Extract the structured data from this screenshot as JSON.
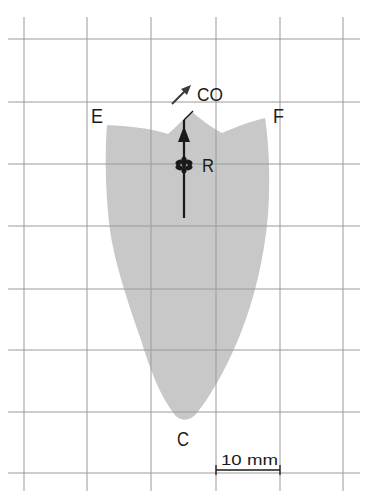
{
  "diagram": {
    "type": "field-map-on-grid",
    "grid": {
      "color": "#9a9a9a",
      "vertical_x": [
        24,
        87,
        151,
        216,
        280,
        343
      ],
      "horizontal_y": [
        39,
        102,
        164,
        226,
        289,
        350,
        412,
        473
      ],
      "x_extent": [
        8,
        360
      ],
      "y_extent": [
        17,
        491
      ]
    },
    "region": {
      "fill": "#c8c8c8",
      "description": "shield-shaped gray region tapering to point C"
    },
    "labels": {
      "E": "E",
      "F": "F",
      "C": "C",
      "R": "R",
      "CO": "CO"
    },
    "scale_bar": {
      "label": "10 mm",
      "x_start": 216,
      "x_end": 280,
      "y": 470
    },
    "colors": {
      "ink": "#1a1a1a",
      "arrow": "#3a3a3a"
    }
  }
}
